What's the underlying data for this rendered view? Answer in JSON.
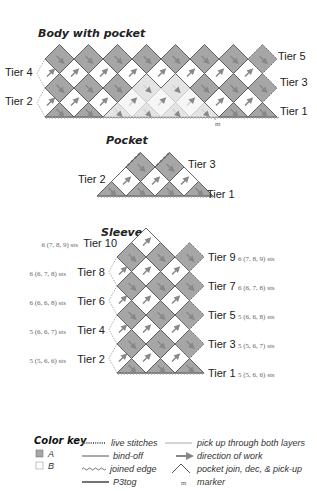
{
  "colors": {
    "A": "#a6a6a6",
    "B": "#ffffff",
    "A_faded": "#e4e4e4",
    "B_faded": "#f6f6f6",
    "outline": "#555555",
    "text": "#222222",
    "sts_text": "#666666"
  },
  "body": {
    "title": "Body with pocket",
    "tiers_left": [
      "Tier 4",
      "Tier 2"
    ],
    "tiers_right": [
      "Tier 5",
      "Tier 3",
      "Tier 1"
    ],
    "marker": "m"
  },
  "pocket": {
    "title": "Pocket",
    "tiers_left": [
      "Tier 2"
    ],
    "tiers_right": [
      "Tier 3",
      "Tier 1"
    ]
  },
  "sleeve": {
    "title": "Sleeve",
    "left": [
      {
        "tier": "Tier 10",
        "sts": "6 (7, 8, 9) sts"
      },
      {
        "tier": "Tier 8",
        "sts": "6 (6, 7, 8) sts"
      },
      {
        "tier": "Tier 6",
        "sts": "6 (6, 6, 8) sts"
      },
      {
        "tier": "Tier 4",
        "sts": "5 (6, 6, 7) sts"
      },
      {
        "tier": "Tier 2",
        "sts": "5 (5, 6, 6) sts"
      }
    ],
    "right": [
      {
        "tier": "Tier 9",
        "sts": "6 (7, 8, 9) sts"
      },
      {
        "tier": "Tier 7",
        "sts": "6 (6, 7, 8) sts"
      },
      {
        "tier": "Tier 5",
        "sts": "5 (6, 6, 8) sts"
      },
      {
        "tier": "Tier 3",
        "sts": "5 (5, 6, 7) sts"
      },
      {
        "tier": "Tier 1",
        "sts": "5 (5, 6, 6) sts"
      }
    ]
  },
  "legend": {
    "title": "Color key",
    "colors": [
      {
        "label": "A",
        "icon": "swatch-gray"
      },
      {
        "label": "B",
        "icon": "swatch-white"
      }
    ],
    "lines": [
      {
        "label": "live stitches",
        "icon": "dotted-line"
      },
      {
        "label": "bind-off",
        "icon": "solid-line"
      },
      {
        "label": "joined edge",
        "icon": "wavy-line"
      },
      {
        "label": "P3tog",
        "icon": "thick-line"
      }
    ],
    "symbols": [
      {
        "label": "pick up through both layers",
        "icon": "gray-line"
      },
      {
        "label": "direction of work",
        "icon": "arrow-right"
      },
      {
        "label": "pocket join, dec, & pick-up",
        "icon": "chevron-up"
      },
      {
        "label": "marker",
        "icon": "m"
      }
    ]
  }
}
